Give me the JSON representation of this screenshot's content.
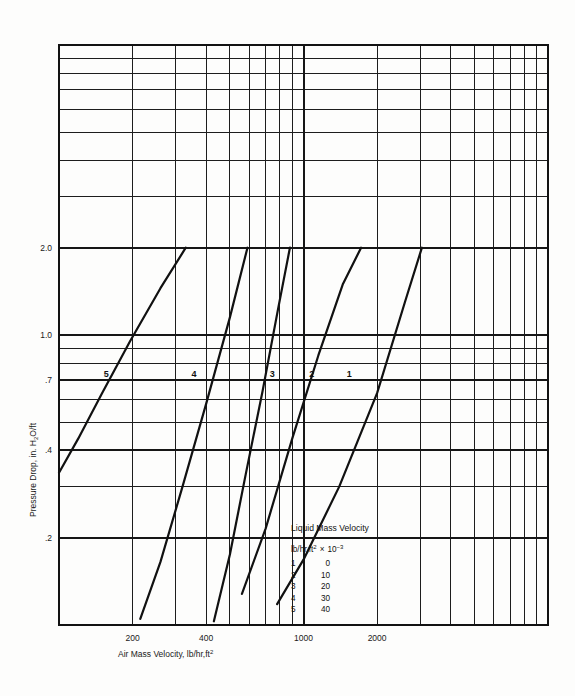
{
  "figure": {
    "background_color": "#fdfdfc",
    "ink_color": "#1a1a1a"
  },
  "axes": {
    "x": {
      "title_main": "Air Mass Velocity, lb/hr,ft",
      "title_exponent": "2",
      "scale": "log",
      "range": [
        100,
        10000
      ],
      "tick_labels": [
        "200",
        "400",
        "1000",
        "2000"
      ],
      "tick_values": [
        200,
        400,
        1000,
        2000
      ]
    },
    "y": {
      "title_pre": "Pressure Drop, in. H",
      "title_sub": "2",
      "title_post": "O/ft",
      "scale": "log",
      "range": [
        0.1,
        10
      ],
      "tick_labels": [
        "2.0",
        "1.0",
        ".7",
        ".4",
        ".2"
      ],
      "tick_values": [
        2.0,
        1.0,
        0.7,
        0.4,
        0.2
      ]
    }
  },
  "legend": {
    "title": "Liquid Mass Velocity",
    "header_main": "lb/hr,ft",
    "header_exponent": "2",
    "header_mult": "×",
    "header_power_base": "10",
    "header_power_exp": "−3",
    "rows": [
      {
        "key": "1",
        "value": "0"
      },
      {
        "key": "2",
        "value": "10"
      },
      {
        "key": "3",
        "value": "20"
      },
      {
        "key": "4",
        "value": "30"
      },
      {
        "key": "5",
        "value": "40"
      }
    ]
  },
  "chart_data": {
    "type": "line",
    "title": "",
    "xlabel": "Air Mass Velocity, lb/hr,ft2",
    "ylabel": "Pressure Drop, in. H2O/ft",
    "xscale": "log",
    "yscale": "log",
    "xlim": [
      100,
      10000
    ],
    "ylim": [
      0.1,
      10
    ],
    "grid": true,
    "legend_position": "inset-lower-right",
    "legend_title": "Liquid Mass Velocity, lb/hr,ft2 x 10^-3",
    "curve_number_label_y": 0.7,
    "series": [
      {
        "name": "1",
        "liquid_mass_velocity": 0,
        "label": "1",
        "label_x": 1540,
        "x": [
          780,
          1000,
          1400,
          2000,
          2600,
          3050
        ],
        "y": [
          0.118,
          0.168,
          0.3,
          0.63,
          1.3,
          2.0
        ]
      },
      {
        "name": "2",
        "liquid_mass_velocity": 10,
        "label": "2",
        "label_x": 1080,
        "x": [
          560,
          700,
          900,
          1150,
          1450,
          1720
        ],
        "y": [
          0.128,
          0.215,
          0.44,
          0.85,
          1.5,
          2.0
        ]
      },
      {
        "name": "3",
        "liquid_mass_velocity": 20,
        "label": "3",
        "label_x": 745,
        "x": [
          430,
          500,
          580,
          680,
          790,
          880
        ],
        "y": [
          0.103,
          0.175,
          0.33,
          0.64,
          1.25,
          2.0
        ]
      },
      {
        "name": "4",
        "liquid_mass_velocity": 30,
        "label": "4",
        "label_x": 357,
        "x": [
          215,
          260,
          320,
          400,
          500,
          590
        ],
        "y": [
          0.105,
          0.165,
          0.3,
          0.58,
          1.15,
          2.0
        ]
      },
      {
        "name": "5",
        "liquid_mass_velocity": 40,
        "label": "5",
        "label_x": 156,
        "x": [
          100,
          120,
          150,
          195,
          260,
          330
        ],
        "y": [
          0.335,
          0.44,
          0.63,
          0.95,
          1.45,
          2.0
        ]
      }
    ]
  }
}
